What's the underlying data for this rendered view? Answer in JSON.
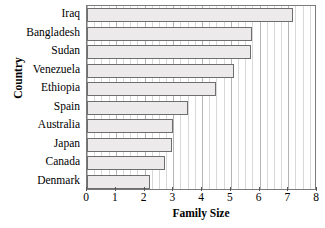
{
  "chart_data": {
    "type": "bar",
    "orientation": "horizontal",
    "title": "",
    "xlabel": "Family Size",
    "ylabel": "Country",
    "categories": [
      "Iraq",
      "Bangladesh",
      "Sudan",
      "Venezuela",
      "Ethiopia",
      "Spain",
      "Australia",
      "Japan",
      "Canada",
      "Denmark"
    ],
    "values": [
      7.15,
      5.75,
      5.7,
      5.1,
      4.5,
      3.5,
      3.0,
      2.95,
      2.7,
      2.2
    ],
    "xlim": [
      0,
      8
    ],
    "xticks": [
      0,
      1,
      2,
      3,
      4,
      5,
      6,
      7,
      8
    ],
    "xtick_labels": [
      "0",
      "1",
      "2",
      "3",
      "4",
      "5",
      "6",
      "7",
      "8"
    ],
    "grid": true,
    "grid_axis": "x",
    "legend": "none",
    "bar_fill_color": "#eceaea",
    "bar_edge_color": "#6e6e6e",
    "frame_color": "#7a7a7a",
    "background_color": "#ffffff"
  }
}
